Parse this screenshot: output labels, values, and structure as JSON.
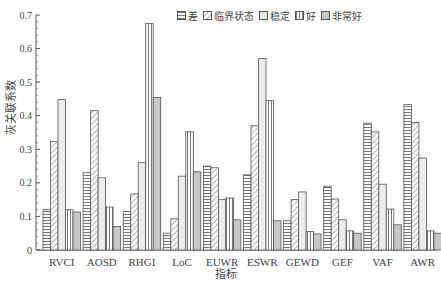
{
  "chart_data": {
    "type": "bar",
    "title": "",
    "xlabel": "指标",
    "ylabel": "灰关联系数",
    "ylim": [
      0,
      0.7
    ],
    "yticks": [
      "0",
      "0.1",
      "0.2",
      "0.3",
      "0.4",
      "0.5",
      "0.6",
      "0.7"
    ],
    "legend_position": "top-right",
    "categories": [
      "RVCI",
      "AOSD",
      "RHGI",
      "LoC",
      "EUWR",
      "ESWR",
      "GEWD",
      "GEF",
      "VAF",
      "AWR"
    ],
    "series": [
      {
        "name": "差",
        "pattern": "horizontal-lines",
        "values": [
          0.12,
          0.23,
          0.115,
          0.05,
          0.25,
          0.224,
          0.087,
          0.19,
          0.378,
          0.433
        ]
      },
      {
        "name": "临界状态",
        "pattern": "diagonal-hatch",
        "values": [
          0.323,
          0.415,
          0.167,
          0.093,
          0.245,
          0.37,
          0.15,
          0.152,
          0.352,
          0.38
        ]
      },
      {
        "name": "稳定",
        "pattern": "light-fill",
        "values": [
          0.448,
          0.215,
          0.26,
          0.22,
          0.15,
          0.57,
          0.173,
          0.09,
          0.196,
          0.274
        ]
      },
      {
        "name": "好",
        "pattern": "vertical-lines",
        "values": [
          0.12,
          0.128,
          0.675,
          0.352,
          0.155,
          0.445,
          0.055,
          0.057,
          0.122,
          0.057
        ]
      },
      {
        "name": "非常好",
        "pattern": "gray-fill",
        "values": [
          0.113,
          0.07,
          0.454,
          0.233,
          0.09,
          0.087,
          0.048,
          0.05,
          0.075,
          0.05
        ]
      }
    ]
  }
}
